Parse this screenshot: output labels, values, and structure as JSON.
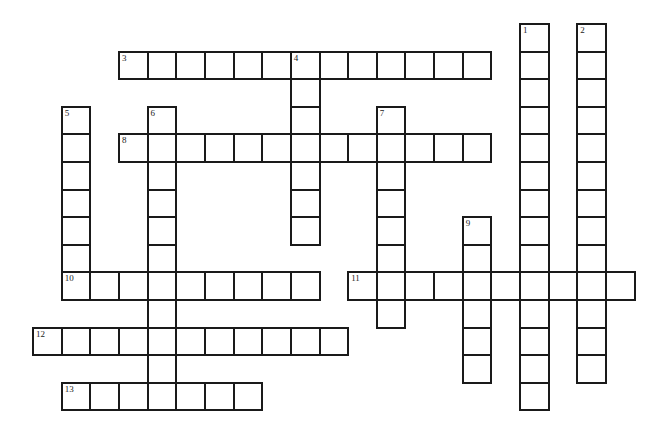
{
  "puzzle": {
    "type": "crossword",
    "grid": {
      "origin_x": 33,
      "origin_y": 24,
      "cell_w": 28.65,
      "cell_h": 27.6
    },
    "words": [
      {
        "number": "1",
        "direction": "down",
        "col": 17,
        "row": 0,
        "length": 14
      },
      {
        "number": "2",
        "direction": "down",
        "col": 19,
        "row": 0,
        "length": 13
      },
      {
        "number": "3",
        "direction": "across",
        "col": 3,
        "row": 1,
        "length": 13
      },
      {
        "number": "4",
        "direction": "down",
        "col": 9,
        "row": 1,
        "length": 7
      },
      {
        "number": "5",
        "direction": "down",
        "col": 1,
        "row": 3,
        "length": 7
      },
      {
        "number": "6",
        "direction": "down",
        "col": 4,
        "row": 3,
        "length": 11
      },
      {
        "number": "7",
        "direction": "down",
        "col": 12,
        "row": 3,
        "length": 8
      },
      {
        "number": "8",
        "direction": "across",
        "col": 3,
        "row": 4,
        "length": 13
      },
      {
        "number": "9",
        "direction": "down",
        "col": 15,
        "row": 7,
        "length": 6
      },
      {
        "number": "10",
        "direction": "across",
        "col": 1,
        "row": 9,
        "length": 9
      },
      {
        "number": "11",
        "direction": "across",
        "col": 11,
        "row": 9,
        "length": 10
      },
      {
        "number": "12",
        "direction": "across",
        "col": 0,
        "row": 11,
        "length": 11
      },
      {
        "number": "13",
        "direction": "across",
        "col": 1,
        "row": 13,
        "length": 7
      }
    ]
  }
}
